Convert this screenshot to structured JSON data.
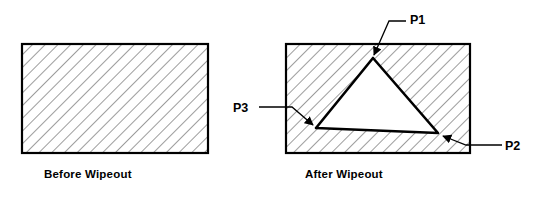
{
  "figure": {
    "type": "technical-diagram",
    "background_color": "#ffffff",
    "line_color": "#000000",
    "hatch_color": "#4a4a4a"
  },
  "captions": {
    "before": "Before Wipeout",
    "after": "After Wipeout"
  },
  "labels": {
    "p1": "P1",
    "p2": "P2",
    "p3": "P3"
  },
  "shapes": {
    "before_rect": {
      "x": 22,
      "y": 44,
      "width": 186,
      "height": 109
    },
    "after_rect": {
      "x": 286,
      "y": 44,
      "width": 184,
      "height": 109
    },
    "wipeout_triangle": {
      "points": "373,58 438,133 316,128",
      "vertices": [
        {
          "name": "P1",
          "x": 373,
          "y": 58
        },
        {
          "name": "P2",
          "x": 438,
          "y": 133
        },
        {
          "name": "P3",
          "x": 316,
          "y": 128
        }
      ]
    }
  },
  "leaders": {
    "p1": {
      "path": "M 406 21 L 389 21 L 374 55",
      "arrow_at": {
        "x": 374,
        "y": 55
      }
    },
    "p2": {
      "path": "M 502 145 L 466 145 L 443 136",
      "arrow_at": {
        "x": 443,
        "y": 136
      }
    },
    "p3": {
      "path": "M 259 107 L 292 107 L 313 125",
      "arrow_at": {
        "x": 313,
        "y": 125
      }
    }
  }
}
